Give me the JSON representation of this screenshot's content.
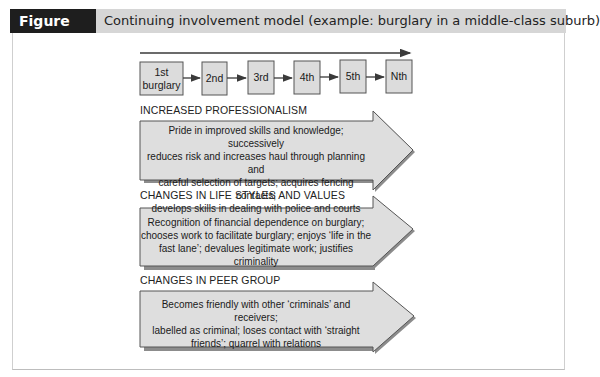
{
  "figure": {
    "label": "Figure 14.4",
    "title": "Continuing involvement model (example: burglary in a middle-class suburb)"
  },
  "stages": [
    {
      "label_line1": "1st",
      "label_line2": "burglary"
    },
    {
      "label_line1": "2nd",
      "label_line2": ""
    },
    {
      "label_line1": "3rd",
      "label_line2": ""
    },
    {
      "label_line1": "4th",
      "label_line2": ""
    },
    {
      "label_line1": "5th",
      "label_line2": ""
    },
    {
      "label_line1": "Nth",
      "label_line2": ""
    }
  ],
  "sections": [
    {
      "title": "INCREASED PROFESSIONALISM",
      "lines": [
        "Pride in improved skills and knowledge; successively",
        "reduces risk and increases haul through planning and",
        "careful selection of targets; acquires fencing contacts;",
        "develops skills in dealing with police and courts"
      ]
    },
    {
      "title": "CHANGES IN LIFE STYLES AND VALUES",
      "lines": [
        "Recognition of financial dependence on burglary;",
        "chooses work to facilitate burglary; enjoys ‘life in the",
        "fast lane’; devalues legitimate work; justifies criminality"
      ]
    },
    {
      "title": "CHANGES IN PEER GROUP",
      "lines": [
        "Becomes friendly with other ‘criminals’ and receivers;",
        "labelled as criminal; loses contact with ‘straight",
        "friends’; quarrel with relations"
      ]
    }
  ],
  "colors": {
    "label_bg": "#1e1e1e",
    "header_bg": "#d6d6d6",
    "box_fill": "#dcdcdc",
    "stroke": "#3a3a3a"
  }
}
